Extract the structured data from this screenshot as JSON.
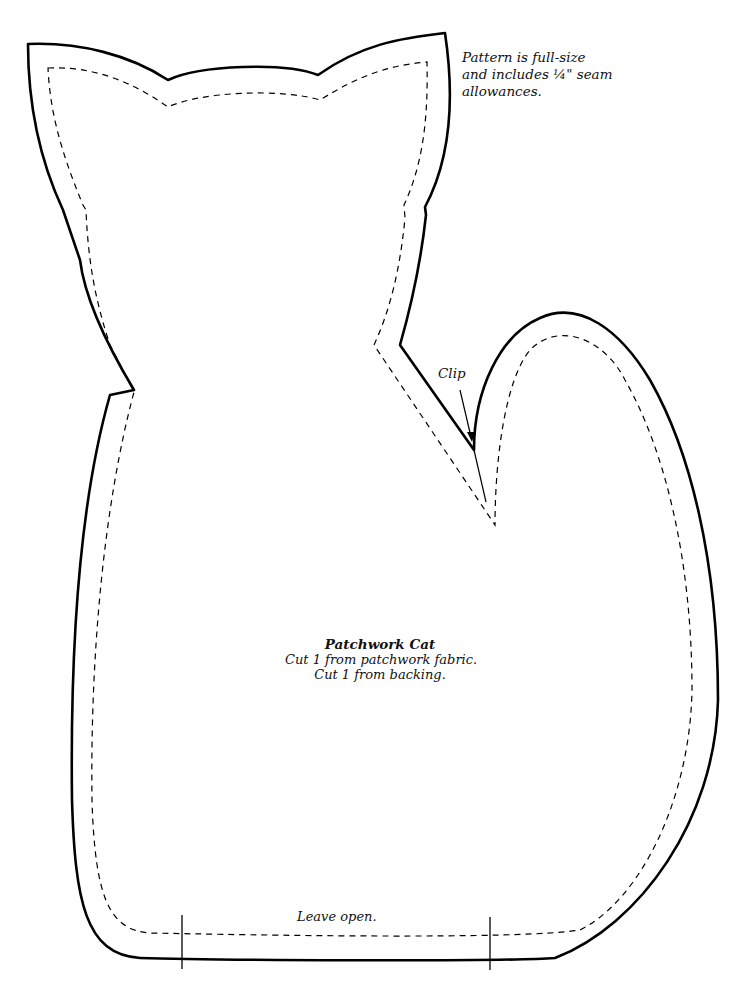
{
  "pattern": {
    "note_lines": [
      "Pattern is full-size",
      "and includes ¼\" seam",
      "allowances."
    ],
    "title": "Patchwork Cat",
    "instructions": [
      "Cut 1 from patchwork fabric.",
      "Cut 1 from backing."
    ],
    "clip_label": "Clip",
    "leave_open_label": "Leave open.",
    "lines": {
      "cut_line": "solid",
      "seam_line": "dashed",
      "stroke_color": "#000000"
    }
  }
}
